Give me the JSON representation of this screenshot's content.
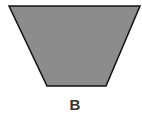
{
  "figure": {
    "label": "B",
    "shape": "inverted-trapezoid",
    "fill_color": "#8c8c8c",
    "stroke_color": "#111111",
    "vertices": [
      [
        9,
        6
      ],
      [
        140,
        6
      ],
      [
        106,
        86
      ],
      [
        47,
        86
      ]
    ]
  }
}
